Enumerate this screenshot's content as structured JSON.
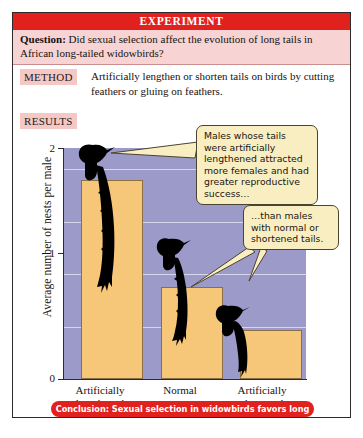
{
  "figure": {
    "banner_title": "EXPERIMENT",
    "question_label": "Question:",
    "question_text": " Did sexual selection affect the evolution of long tails in African long-tailed widowbirds?",
    "method_label": "METHOD",
    "method_text": "Artificially lengthen or shorten tails on birds by cutting feathers or gluing on feathers.",
    "results_label": "RESULTS",
    "conclusion_text": "Conclusion: Sexual selection in widowbirds favors long tails."
  },
  "callouts": [
    {
      "id": "callout-1",
      "text": "Males whose tails were artificially lengthened attracted more females and had greater reproductive success…"
    },
    {
      "id": "callout-2",
      "text": "…than males with normal or shortened tails."
    }
  ],
  "colors": {
    "banner_red": "#e0211e",
    "question_pink": "#f7d4d3",
    "tag_pink": "#f5c8c6",
    "plot_background": "#9c9ac9",
    "bar_fill": "#f6c679",
    "bar_stroke": "#8a7044",
    "gridline": "#d8d7ea",
    "callout_fill": "#f9eec2",
    "callout_stroke": "#4a4330",
    "bird_silhouette": "#000000"
  },
  "chart_data": {
    "type": "bar",
    "title": "",
    "xlabel": "",
    "ylabel": "Average number of nests per male",
    "categories": [
      "Artificially lengthened",
      "Normal",
      "Artificially shortened"
    ],
    "category_lines": [
      [
        "Artificially",
        "lengthened"
      ],
      [
        "Normal"
      ],
      [
        "Artificially",
        "shortened"
      ]
    ],
    "values": [
      1.9,
      0.88,
      0.47
    ],
    "ylim": [
      0,
      2.2
    ],
    "yticks": [
      0,
      1,
      2
    ],
    "ytick_labels": [
      "0",
      "1",
      "2"
    ],
    "gridlines": [
      0.5,
      1.0,
      1.5,
      2.0
    ],
    "grid": true,
    "legend": "none",
    "annotations": [
      "Males whose tails were artificially lengthened attracted more females and had greater reproductive success…",
      "…than males with normal or shortened tails."
    ],
    "bird_icons": [
      {
        "category": "Artificially lengthened",
        "tail": "long"
      },
      {
        "category": "Normal",
        "tail": "medium"
      },
      {
        "category": "Artificially shortened",
        "tail": "short"
      }
    ]
  }
}
